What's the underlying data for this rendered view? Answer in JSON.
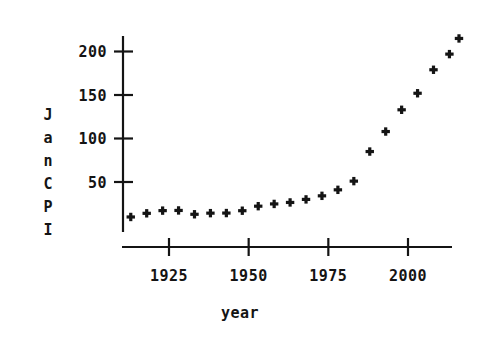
{
  "chart_data": {
    "type": "scatter",
    "title": "",
    "xlabel": "year",
    "ylabel": "JanCPI",
    "ylabel_chars": [
      "J",
      "a",
      "n",
      "C",
      "P",
      "I"
    ],
    "xlim": [
      1910,
      2019
    ],
    "ylim": [
      0,
      228
    ],
    "grid": false,
    "legend": null,
    "marker": "plus",
    "marker_color": "#141414",
    "axis_color": "#141414",
    "background": "#ffffff",
    "xticks": [
      1925,
      1950,
      1975,
      2000
    ],
    "xtick_labels": [
      "1925",
      "1950",
      "1975",
      "2000"
    ],
    "yticks": [
      50,
      100,
      150,
      200
    ],
    "ytick_labels": [
      "50",
      "100",
      "150",
      "200"
    ],
    "x": [
      1913,
      1918,
      1923,
      1928,
      1933,
      1938,
      1943,
      1948,
      1953,
      1958,
      1963,
      1968,
      1973,
      1978,
      1983,
      1988,
      1993,
      1998,
      2003,
      2008,
      2013,
      2016
    ],
    "values": [
      9.8,
      14.0,
      17.1,
      17.3,
      12.9,
      14.2,
      14.3,
      17.0,
      22.2,
      24.8,
      26.5,
      30.0,
      34.1,
      41.0,
      51.0,
      85.0,
      108.0,
      133.0,
      152.0,
      179.0,
      197.0,
      215.0
    ],
    "series": [
      {
        "name": "JanCPI",
        "points": [
          {
            "year": 1913,
            "cpi": 9.8
          },
          {
            "year": 1918,
            "cpi": 14.0
          },
          {
            "year": 1923,
            "cpi": 17.1
          },
          {
            "year": 1928,
            "cpi": 17.3
          },
          {
            "year": 1933,
            "cpi": 12.9
          },
          {
            "year": 1938,
            "cpi": 14.2
          },
          {
            "year": 1943,
            "cpi": 14.3
          },
          {
            "year": 1948,
            "cpi": 17.0
          },
          {
            "year": 1953,
            "cpi": 22.2
          },
          {
            "year": 1958,
            "cpi": 24.8
          },
          {
            "year": 1963,
            "cpi": 26.5
          },
          {
            "year": 1968,
            "cpi": 30.0
          },
          {
            "year": 1973,
            "cpi": 34.1
          },
          {
            "year": 1978,
            "cpi": 41.0
          },
          {
            "year": 1983,
            "cpi": 51.0
          },
          {
            "year": 1988,
            "cpi": 85.0
          },
          {
            "year": 1993,
            "cpi": 108.0
          },
          {
            "year": 1998,
            "cpi": 133.0
          },
          {
            "year": 2003,
            "cpi": 152.0
          },
          {
            "year": 2008,
            "cpi": 179.0
          },
          {
            "year": 2013,
            "cpi": 197.0
          },
          {
            "year": 2016,
            "cpi": 215.0
          }
        ]
      }
    ]
  }
}
